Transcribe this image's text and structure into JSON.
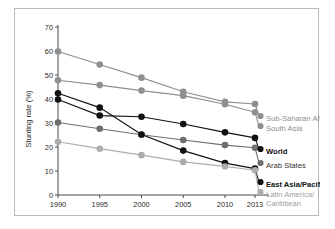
{
  "chart_data": {
    "type": "line",
    "title": "",
    "subtitle": "",
    "xlabel": "",
    "ylabel": "Stunting rate (%)",
    "x": [
      1990,
      1995,
      2000,
      2005,
      2010,
      2013
    ],
    "xtick_labels": [
      "1990",
      "1995",
      "2000",
      "2005",
      "2010",
      "2013"
    ],
    "ytick_labels": [
      "0",
      "10",
      "20",
      "30",
      "40",
      "50",
      "60",
      "70"
    ],
    "yticks": [
      0,
      10,
      20,
      30,
      40,
      50,
      60,
      70
    ],
    "ylim": [
      0,
      70
    ],
    "xlim": [
      1990,
      2013
    ],
    "grid": false,
    "legend_position": "right-inline",
    "series": [
      {
        "name": "Sub-Saharan Africa",
        "color": "#8f8f8f",
        "label_color": "#8f8f8f",
        "bold_label": false,
        "values": [
          59.8,
          54.4,
          48.9,
          43.0,
          38.8,
          37.9
        ]
      },
      {
        "name": "South Asia",
        "color": "#8f8f8f",
        "label_color": "#8f8f8f",
        "bold_label": false,
        "values": [
          47.8,
          45.8,
          43.5,
          41.4,
          37.8,
          34.5
        ]
      },
      {
        "name": "World",
        "color": "#111111",
        "label_color": "#111111",
        "bold_label": true,
        "values": [
          39.8,
          33.1,
          32.6,
          29.6,
          26.1,
          23.8
        ]
      },
      {
        "name": "Arab States",
        "color": "#6f6f6f",
        "label_color": "#333333",
        "bold_label": false,
        "values": [
          30.2,
          27.6,
          25.1,
          22.9,
          20.8,
          19.7
        ]
      },
      {
        "name": "East Asia/Pacific",
        "color": "#111111",
        "label_color": "#111111",
        "bold_label": true,
        "values": [
          42.4,
          36.4,
          25.2,
          18.5,
          13.3,
          11.0
        ]
      },
      {
        "name": "Latin America/ Caribbean",
        "color": "#adadad",
        "label_color": "#9d9d9d",
        "bold_label": false,
        "values": [
          22.2,
          19.3,
          16.6,
          13.8,
          11.9,
          10.3
        ]
      }
    ],
    "series_labels": [
      "Sub-Saharan Africa",
      "South Asia",
      "World",
      "Arab States",
      "East Asia/Pacific",
      "Latin America/",
      "Caribbean"
    ]
  }
}
